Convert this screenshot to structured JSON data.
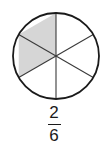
{
  "figure": {
    "type": "fraction-circle-model",
    "title": "",
    "fraction": {
      "numerator": "2",
      "denominator": "6",
      "display": "2/6"
    },
    "circle": {
      "center_x": 56,
      "center_y": 56,
      "radius": 43,
      "total_sectors": 6,
      "shaded_sectors": 2,
      "sector_angle_degrees": 60,
      "outline_color": "#1a1a1a",
      "outline_width": 1.8,
      "spoke_color": "#3a3a3a",
      "spoke_width": 1.1,
      "shaded_fill": "#d6d6d6",
      "unshaded_fill": "#ffffff",
      "sectors": [
        {
          "index": 1,
          "start_deg": -90,
          "end_deg": -30,
          "shaded": false,
          "label": "top-right-sector"
        },
        {
          "index": 2,
          "start_deg": -30,
          "end_deg": 30,
          "shaded": false,
          "label": "right-sector"
        },
        {
          "index": 3,
          "start_deg": 30,
          "end_deg": 90,
          "shaded": false,
          "label": "bottom-right-sector"
        },
        {
          "index": 4,
          "start_deg": 90,
          "end_deg": 150,
          "shaded": false,
          "label": "bottom-left-sector"
        },
        {
          "index": 5,
          "start_deg": 150,
          "end_deg": 210,
          "shaded": true,
          "label": "left-sector"
        },
        {
          "index": 6,
          "start_deg": 210,
          "end_deg": 270,
          "shaded": true,
          "label": "top-left-sector"
        }
      ]
    },
    "background_color": "#ffffff"
  }
}
